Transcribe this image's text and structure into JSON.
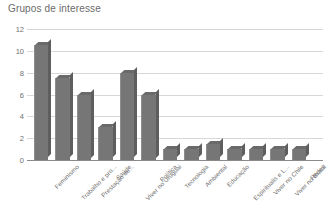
{
  "chart_data": {
    "type": "bar",
    "title": "Grupos de interesse",
    "xlabel": "",
    "ylabel": "",
    "ylim": [
      0,
      12
    ],
    "yticks": [
      0,
      2,
      4,
      6,
      8,
      10,
      12
    ],
    "grid": true,
    "legend": "none",
    "categories": [
      "Feminismo",
      "Trabalho e pro...",
      "Prestação de...",
      "Saúde",
      "Viver no Uruguai",
      "Política",
      "Tecnologia",
      "Ambiental",
      "Educação",
      "Espiritualis e L...",
      "Viver no Chile",
      "Viver no Brasil",
      "Redes"
    ],
    "values": [
      10.5,
      7.5,
      6,
      3,
      8,
      6,
      1,
      1,
      1.5,
      1,
      1,
      1,
      1
    ],
    "colors": {
      "bar_face": "#767676",
      "bar_top": "#6a6a6a",
      "bar_side": "#5e5e5e",
      "gridline": "#d8d8d8",
      "axis": "#8a8a8a",
      "text": "#6f6f6f",
      "background": "#ffffff"
    }
  }
}
